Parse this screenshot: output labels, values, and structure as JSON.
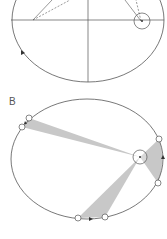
{
  "diagram": {
    "panels": [
      {
        "label": "A",
        "description": "Elliptical orbit with two foci; Sun at one focus; lines from foci to planet",
        "visible_label": false
      },
      {
        "label": "B",
        "description": "Equal areas swept in equal times; three shaded sectors from Sun to orbit",
        "visible_label": true
      }
    ],
    "colors": {
      "line": "#555555",
      "shade": "#c8c8c8",
      "background": "#ffffff"
    }
  }
}
